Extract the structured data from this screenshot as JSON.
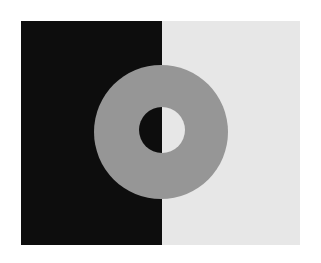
{
  "figure": {
    "canvas": {
      "width": 321,
      "height": 263,
      "background_color": "#ffffff"
    },
    "plate": {
      "name": "split background plate",
      "x": 21,
      "y": 21,
      "width": 279,
      "height": 224,
      "divide_x": 162,
      "halves": [
        {
          "label": "dark half",
          "side": "left",
          "color": "#0d0d0d",
          "x": 21,
          "width": 141
        },
        {
          "label": "light half",
          "side": "right",
          "color": "#e7e7e7",
          "x": 162,
          "width": 138
        }
      ]
    },
    "annulus": {
      "label": "gray ring",
      "color": "#969696",
      "center_x": 161,
      "center_y": 132,
      "outer_diameter": 134,
      "inner_diameter": 46,
      "inner_hole_label": "ring aperture showing background",
      "inner_hole_center_x": 162,
      "inner_hole_center_y": 130
    }
  }
}
